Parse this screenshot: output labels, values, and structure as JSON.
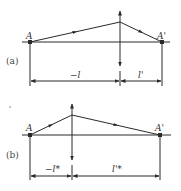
{
  "figure": {
    "type": "optical-lens-ray-diagram",
    "panels": [
      {
        "id": "a",
        "panel_label": "(a)",
        "object_point": "A",
        "image_point": "A'",
        "object_distance_label": "−l",
        "image_distance_label": "l'"
      },
      {
        "id": "b",
        "panel_label": "(b)",
        "object_point": "A",
        "image_point": "A'",
        "object_distance_label": "−l*",
        "image_distance_label": "l'*"
      }
    ],
    "colors": {
      "line": "#2a2a2a",
      "text": "#333333",
      "background": "#ffffff"
    }
  }
}
